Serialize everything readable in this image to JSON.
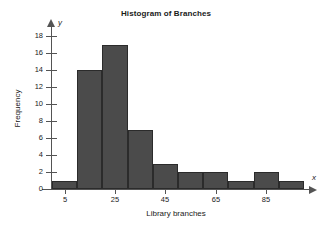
{
  "chart_data": {
    "type": "bar",
    "title": "Histogram of Branches",
    "xlabel": "Library branches",
    "ylabel": "Frequency",
    "x_axis_letter": "y",
    "y_axis_letter": "x",
    "categories": [
      "5",
      "15",
      "25",
      "35",
      "45",
      "55",
      "65",
      "75",
      "85",
      "95"
    ],
    "values": [
      1,
      14,
      17,
      7,
      3,
      2,
      2,
      1,
      2,
      1
    ],
    "bin_width": 10,
    "bin_edges": [
      0,
      10,
      20,
      30,
      40,
      50,
      60,
      70,
      80,
      90,
      100
    ],
    "xlim": [
      0,
      100
    ],
    "ylim": [
      0,
      19
    ],
    "x_ticks": [
      5,
      25,
      45,
      65,
      85
    ],
    "x_tick_labels": [
      "5",
      "25",
      "45",
      "65",
      "85"
    ],
    "y_ticks": [
      0,
      2,
      4,
      6,
      8,
      10,
      12,
      14,
      16,
      18
    ],
    "y_tick_labels": [
      "0",
      "2",
      "4",
      "6",
      "8",
      "10",
      "12",
      "14",
      "16",
      "18"
    ],
    "grid": false,
    "legend": false,
    "bar_color": "#4b4b4b",
    "bar_edge_color": "#2b2b2b",
    "axis_color": "#545454",
    "background_color": "#ffffff"
  }
}
